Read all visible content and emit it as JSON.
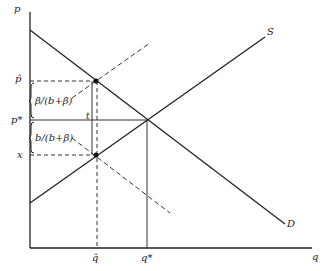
{
  "diagram": {
    "axes": {
      "y_label": "p",
      "x_label": "q"
    },
    "curves": {
      "supply": "S",
      "demand": "D"
    },
    "price_labels": {
      "p_hat": "p̂",
      "p_star": "p*",
      "x": "x"
    },
    "quantity_labels": {
      "q_hat": "q̂",
      "q_star": "q*"
    },
    "annotations": {
      "upper_share": "β/(b+β)",
      "lower_share": "b/(b+β)",
      "tax": "t"
    }
  }
}
